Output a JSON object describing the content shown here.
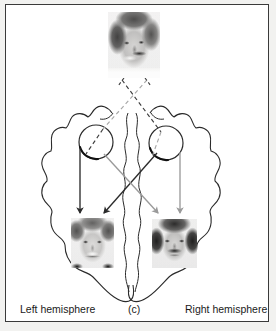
{
  "figure": {
    "panel_label": "(c)",
    "left_label": "Left hemisphere",
    "right_label": "Right hemisphere",
    "border_color": "#3a3a3a",
    "background_color": "#ffffff",
    "outer_margin_color": "#f2f2f0"
  },
  "colors": {
    "outline": "#2b2b2b",
    "dark_arrow": "#2b2b2b",
    "gray_arrow": "#9a9a9a",
    "dashed_dark": "#3d3d3d",
    "dashed_gray": "#a8a8a8",
    "text": "#1a1a1a"
  },
  "stimulus": {
    "name": "chimeric-face",
    "description": "Composite face: smiling woman on viewer-left half, mustached man on viewer-right half",
    "x": 108,
    "y": 12,
    "width": 52,
    "height": 66
  },
  "eyes": [
    {
      "name": "left-eye",
      "cx": 96,
      "cy": 142,
      "r": 17
    },
    {
      "name": "right-eye",
      "cx": 166,
      "cy": 143,
      "r": 17
    }
  ],
  "percepts": [
    {
      "name": "left-hemisphere-percept",
      "description": "Smiling woman face (duplicated half) perceived in left visual field",
      "x": 71,
      "y": 218,
      "width": 43,
      "height": 50
    },
    {
      "name": "right-hemisphere-percept",
      "description": "Mustached man face (duplicated half) perceived in right visual field",
      "x": 152,
      "y": 219,
      "width": 45,
      "height": 49
    }
  ],
  "projections": {
    "dashed": [
      {
        "name": "dash-left-face-to-right-eye",
        "x1": 122,
        "y1": 80,
        "x2": 160,
        "y2": 131,
        "tone": "dark"
      },
      {
        "name": "dash-right-face-to-left-eye",
        "x1": 147,
        "y1": 80,
        "x2": 104,
        "y2": 128,
        "tone": "gray"
      },
      {
        "name": "dash-left-eye-inner",
        "x1": 104,
        "y1": 128,
        "x2": 88,
        "y2": 152,
        "tone": "dark"
      },
      {
        "name": "dash-right-eye-inner",
        "x1": 160,
        "y1": 131,
        "x2": 152,
        "y2": 155,
        "tone": "gray"
      }
    ],
    "arrows": [
      {
        "name": "arrow-left-eye-ipsilateral",
        "x1": 86,
        "y1": 150,
        "x2": 86,
        "y2": 214,
        "tone": "dark"
      },
      {
        "name": "arrow-right-eye-contralateral",
        "x1": 158,
        "y1": 152,
        "x2": 106,
        "y2": 214,
        "tone": "dark"
      },
      {
        "name": "arrow-left-eye-contralateral",
        "x1": 104,
        "y1": 152,
        "x2": 160,
        "y2": 214,
        "tone": "gray"
      },
      {
        "name": "arrow-right-eye-ipsilateral",
        "x1": 180,
        "y1": 152,
        "x2": 180,
        "y2": 214,
        "tone": "gray"
      }
    ]
  }
}
